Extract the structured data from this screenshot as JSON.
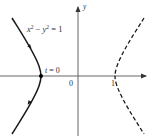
{
  "diagram": {
    "equation": "x² − y² = 1",
    "equation_parts": {
      "x": "x",
      "sup1": "2",
      "minus": " − ",
      "y": "y",
      "sup2": "2",
      "rhs": " = 1"
    },
    "point_label": "t = 0",
    "point_label_parts": {
      "t": "t",
      "rest": " = 0"
    },
    "origin_label": "0",
    "tick_label": "1",
    "y_axis_label": "y",
    "colors": {
      "curve": "#1a1a1a",
      "axis": "#333333",
      "background": "#ffffff"
    },
    "left_branch": {
      "style": "solid",
      "direction": "upward",
      "marked_point": "(-1, 0)"
    },
    "right_branch": {
      "style": "dashed"
    }
  }
}
